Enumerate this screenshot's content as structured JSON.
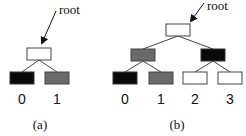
{
  "colors": {
    "black": "#0a0a0a",
    "gray": "#6a6a6a",
    "white": "#ffffff",
    "stroke": "#444444"
  },
  "diagram_a": {
    "caption": "(a)",
    "root_label": "root",
    "leaf_labels": [
      "0",
      "1"
    ]
  },
  "diagram_b": {
    "caption": "(b)",
    "root_label": "root",
    "leaf_labels": [
      "0",
      "1",
      "2",
      "3"
    ]
  }
}
